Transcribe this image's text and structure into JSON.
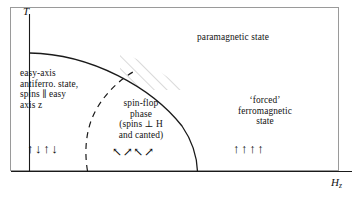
{
  "figure": {
    "type": "phase-diagram",
    "axes": {
      "y_label": "T",
      "x_label_base": "H",
      "x_label_sub": "z"
    },
    "regions": {
      "paramagnetic": "paramagnetic state",
      "easy_axis": "easy-axis\nantiferro. state,\nspins ∥ easy\naxis z",
      "spin_flop": "spin-flop\nphase\n(spins ⊥ H\nand canted)",
      "forced_ferro": "‘forced’\nferromagnetic\nstate"
    },
    "spin_configs": {
      "antiferro_arrows": "↑↓↑↓",
      "spin_flop_arrows": "↖↗↖↗",
      "ferro_arrows": "↑↑↑↑"
    },
    "colors": {
      "line": "#1a1a1a",
      "hatch": "#b9b9b9",
      "frame": "#9a9a9a",
      "background": "#ffffff"
    }
  }
}
